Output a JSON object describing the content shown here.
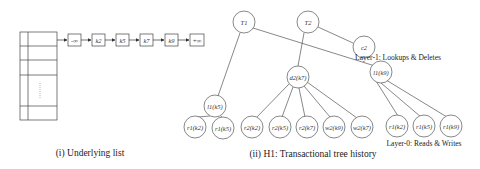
{
  "list": {
    "caption": "(i) Underlying list",
    "keys": [
      "-∞",
      "k2",
      "k5",
      "k7",
      "k9",
      "+∞"
    ]
  },
  "tree": {
    "caption": "(ii) H1: Transactional tree history",
    "layer1_label": "Layer-1: Lookups & Deletes",
    "layer0_label": "Layer-0: Reads & Writes",
    "roots": [
      {
        "id": "T1",
        "label": "T1"
      },
      {
        "id": "T2",
        "label": "T2"
      },
      {
        "id": "c2",
        "label": "c2"
      }
    ],
    "layer1": [
      {
        "id": "l1k5",
        "label": "l1(k5)",
        "parent": "T1"
      },
      {
        "id": "d2k7",
        "label": "d2(k7)",
        "parent": "T2"
      },
      {
        "id": "l1k9",
        "label": "l1(k9)",
        "parent": "T1"
      }
    ],
    "layer0": [
      {
        "label": "r1(k2)",
        "parent": "l1k5"
      },
      {
        "label": "r1(k5)",
        "parent": "l1k5"
      },
      {
        "label": "r2(k2)",
        "parent": "d2k7"
      },
      {
        "label": "r2(k5)",
        "parent": "d2k7"
      },
      {
        "label": "r2(k7)",
        "parent": "d2k7"
      },
      {
        "label": "w2(k9)",
        "parent": "d2k7"
      },
      {
        "label": "w2(k7)",
        "parent": "d2k7"
      },
      {
        "label": "r1(k2)",
        "parent": "l1k9"
      },
      {
        "label": "r1(k5)",
        "parent": "l1k9"
      },
      {
        "label": "r1(k9)",
        "parent": "l1k9"
      }
    ]
  }
}
